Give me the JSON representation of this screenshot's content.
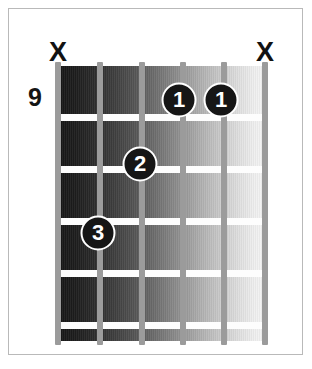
{
  "diagram": {
    "type": "guitar-chord-diagram",
    "start_fret_label": "9",
    "string_count": 6,
    "fret_count": 5,
    "background_color": "#ffffff",
    "frame_color": "#b9b9b9",
    "fret_line_color": "#fdfdfd",
    "string_color": "#9b9b9b",
    "dot_fill_color": "#161616",
    "dot_text_color": "#ffffff",
    "marker_color": "#121212",
    "strings": [
      {
        "index": 1,
        "x": 58
      },
      {
        "index": 2,
        "x": 100
      },
      {
        "index": 3,
        "x": 142
      },
      {
        "index": 4,
        "x": 183
      },
      {
        "index": 5,
        "x": 224
      },
      {
        "index": 6,
        "x": 265
      }
    ],
    "fret_lines": [
      {
        "index": 1,
        "y": 114
      },
      {
        "index": 2,
        "y": 166
      },
      {
        "index": 3,
        "y": 218
      },
      {
        "index": 4,
        "y": 270
      },
      {
        "index": 5,
        "y": 322
      }
    ],
    "mute_markers": [
      {
        "label": "X",
        "string": 1,
        "x": 58,
        "y": 52
      },
      {
        "label": "X",
        "string": 6,
        "x": 265,
        "y": 52
      }
    ],
    "fret_number": {
      "label": "9",
      "x": 35,
      "y": 97
    },
    "finger_dots": [
      {
        "label": "1",
        "string": 4,
        "fret": 1,
        "x": 179,
        "y": 100
      },
      {
        "label": "1",
        "string": 5,
        "fret": 1,
        "x": 221,
        "y": 100
      },
      {
        "label": "2",
        "string": 3,
        "fret": 2,
        "x": 140,
        "y": 164
      },
      {
        "label": "3",
        "string": 2,
        "fret": 3,
        "x": 98,
        "y": 233
      }
    ]
  }
}
